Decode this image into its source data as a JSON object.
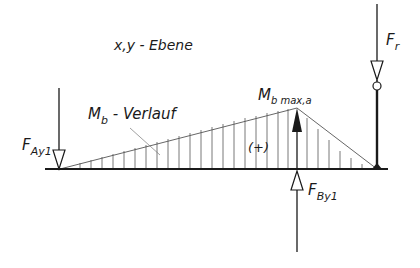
{
  "diagram": {
    "plane_label": "x,y - Ebene",
    "moment_curve_label_main": "M",
    "moment_curve_label_sub": "b",
    "moment_curve_label_suffix": " - Verlauf",
    "max_moment_label_main": "M",
    "max_moment_label_sub": "b max,a",
    "sign_label": "(+)",
    "force_A_main": "F",
    "force_A_sub": "Ay1",
    "force_B_main": "F",
    "force_B_sub": "By1",
    "force_r_main": "F",
    "force_r_sub": "r",
    "colors": {
      "line": "#1a1a1a",
      "hatch": "#555555",
      "background": "#ffffff"
    }
  }
}
